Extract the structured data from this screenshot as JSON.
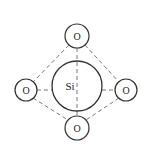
{
  "diagram": {
    "center_atom": {
      "label": "Si",
      "cx": 77,
      "cy": 86,
      "r": 25
    },
    "oxygen_atoms": [
      {
        "label": "O",
        "position": "top",
        "cx": 77,
        "cy": 36,
        "r": 12
      },
      {
        "label": "O",
        "position": "left",
        "cx": 26,
        "cy": 90,
        "r": 11
      },
      {
        "label": "O",
        "position": "right",
        "cx": 126,
        "cy": 90,
        "r": 11
      },
      {
        "label": "O",
        "position": "bottom",
        "cx": 77,
        "cy": 128,
        "r": 12
      }
    ],
    "colors": {
      "stroke": "#333333",
      "dash": "#555555",
      "background": "#ffffff"
    }
  }
}
